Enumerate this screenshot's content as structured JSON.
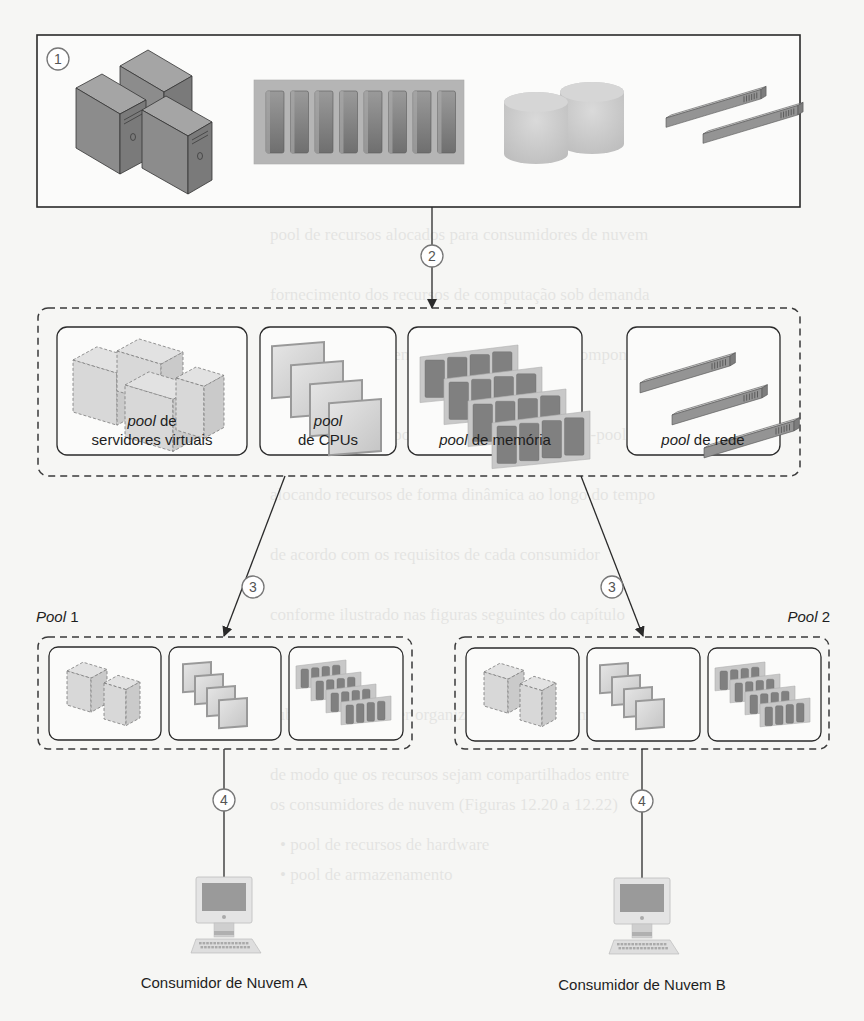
{
  "steps": [
    "1",
    "2",
    "3",
    "3",
    "4",
    "4"
  ],
  "physical_resources": {
    "step": "1",
    "items": [
      "servers-icon",
      "cpu-rack-icon",
      "storage-icon",
      "network-switch-icon"
    ]
  },
  "resource_pools": {
    "step": "2",
    "pools": [
      {
        "label_italic": "pool",
        "label_rest": " de",
        "label_line2": "servidores virtuais",
        "icon": "virtual-servers-icon"
      },
      {
        "label_italic": "pool",
        "label_rest": "",
        "label_line2": "de CPUs",
        "icon": "cpu-pool-icon"
      },
      {
        "label_italic": "pool",
        "label_rest": " de memória",
        "label_line2": "",
        "icon": "memory-pool-icon"
      },
      {
        "label_italic": "pool",
        "label_rest": " de rede",
        "label_line2": "",
        "icon": "network-pool-icon"
      }
    ]
  },
  "sub_pools": [
    {
      "title_italic": "Pool",
      "title_rest": " 1",
      "step": "3",
      "consumer_step": "4",
      "consumer": "Consumidor de Nuvem A"
    },
    {
      "title_italic": "Pool",
      "title_rest": " 2",
      "step": "3",
      "consumer_step": "4",
      "consumer": "Consumidor de Nuvem B"
    }
  ],
  "colors": {
    "background": "#f6f6f4",
    "line": "#2a2a2a",
    "device_fill": "#8a8a8a",
    "device_light": "#c9c9c9",
    "circle_stroke": "#777777"
  }
}
